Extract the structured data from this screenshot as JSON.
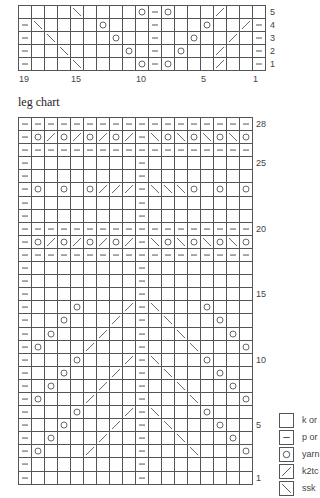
{
  "top_chart": {
    "columns": 19,
    "rows": [
      {
        "label": "5",
        "cells": [
          "",
          "",
          "",
          "",
          "ssk",
          "",
          "",
          "",
          "",
          "yo",
          "p",
          "yo",
          "",
          "",
          "",
          "k2tog",
          "",
          "",
          ""
        ]
      },
      {
        "label": "4",
        "cells": [
          "p",
          "ssk",
          "",
          "",
          "",
          "",
          "yo",
          "",
          "",
          "",
          "p",
          "",
          "",
          "",
          "yo",
          "",
          "",
          "k2tog",
          "p"
        ]
      },
      {
        "label": "3",
        "cells": [
          "p",
          "",
          "ssk",
          "",
          "",
          "",
          "",
          "yo",
          "",
          "",
          "p",
          "",
          "",
          "yo",
          "",
          "",
          "k2tog",
          "",
          "p"
        ]
      },
      {
        "label": "2",
        "cells": [
          "p",
          "",
          "",
          "ssk",
          "",
          "",
          "",
          "",
          "yo",
          "",
          "p",
          "",
          "yo",
          "",
          "",
          "k2tog",
          "",
          "",
          "p"
        ]
      },
      {
        "label": "1",
        "cells": [
          "p",
          "",
          "",
          "",
          "ssk",
          "",
          "",
          "",
          "",
          "yo",
          "p",
          "yo",
          "",
          "",
          "",
          "k2tog",
          "",
          "",
          "p"
        ]
      }
    ],
    "row_labels_shown": [
      "5",
      "4",
      "3",
      "2",
      "1"
    ],
    "col_labels": [
      {
        "text": "19",
        "col": 0
      },
      {
        "text": "15",
        "col": 4
      },
      {
        "text": "10",
        "col": 9
      },
      {
        "text": "5",
        "col": 14
      },
      {
        "text": "1",
        "col": 18
      }
    ]
  },
  "leg_chart": {
    "title": "leg chart",
    "columns": 18,
    "rows": [
      {
        "num": 28,
        "label": "28",
        "cells": [
          "p",
          "p",
          "p",
          "p",
          "p",
          "p",
          "p",
          "p",
          "p",
          "p",
          "p",
          "p",
          "p",
          "p",
          "p",
          "p",
          "p",
          "p"
        ]
      },
      {
        "num": 27,
        "label": "",
        "cells": [
          "p",
          "yo",
          "k2tog",
          "yo",
          "k2tog",
          "yo",
          "k2tog",
          "yo",
          "k2tog",
          "p",
          "ssk",
          "yo",
          "ssk",
          "yo",
          "ssk",
          "yo",
          "ssk",
          "yo"
        ]
      },
      {
        "num": 26,
        "label": "",
        "cells": [
          "p",
          "p",
          "p",
          "p",
          "p",
          "p",
          "p",
          "p",
          "p",
          "p",
          "p",
          "p",
          "p",
          "p",
          "p",
          "p",
          "p",
          "p"
        ]
      },
      {
        "num": 25,
        "label": "25",
        "cells": [
          "p",
          "",
          "",
          "",
          "",
          "",
          "",
          "",
          "",
          "p",
          "",
          "",
          "",
          "",
          "",
          "",
          "",
          ""
        ]
      },
      {
        "num": 24,
        "label": "",
        "cells": [
          "p",
          "",
          "",
          "",
          "",
          "",
          "",
          "",
          "",
          "p",
          "",
          "",
          "",
          "",
          "",
          "",
          "",
          ""
        ]
      },
      {
        "num": 23,
        "label": "",
        "cells": [
          "p",
          "yo",
          "",
          "yo",
          "",
          "yo",
          "k2tog",
          "k2tog",
          "k2tog",
          "p",
          "ssk",
          "ssk",
          "ssk",
          "yo",
          "",
          "yo",
          "",
          "yo"
        ]
      },
      {
        "num": 22,
        "label": "",
        "cells": [
          "p",
          "",
          "",
          "",
          "",
          "",
          "",
          "",
          "",
          "p",
          "",
          "",
          "",
          "",
          "",
          "",
          "",
          ""
        ]
      },
      {
        "num": 21,
        "label": "",
        "cells": [
          "p",
          "",
          "",
          "",
          "",
          "",
          "",
          "",
          "",
          "p",
          "",
          "",
          "",
          "",
          "",
          "",
          "",
          ""
        ]
      },
      {
        "num": 20,
        "label": "20",
        "cells": [
          "p",
          "p",
          "p",
          "p",
          "p",
          "p",
          "p",
          "p",
          "p",
          "p",
          "p",
          "p",
          "p",
          "p",
          "p",
          "p",
          "p",
          "p"
        ]
      },
      {
        "num": 19,
        "label": "",
        "cells": [
          "p",
          "yo",
          "k2tog",
          "yo",
          "k2tog",
          "yo",
          "k2tog",
          "yo",
          "k2tog",
          "p",
          "ssk",
          "yo",
          "ssk",
          "yo",
          "ssk",
          "yo",
          "ssk",
          "yo"
        ]
      },
      {
        "num": 18,
        "label": "",
        "cells": [
          "p",
          "p",
          "p",
          "p",
          "p",
          "p",
          "p",
          "p",
          "p",
          "p",
          "p",
          "p",
          "p",
          "p",
          "p",
          "p",
          "p",
          "p"
        ]
      },
      {
        "num": 17,
        "label": "",
        "cells": [
          "p",
          "",
          "",
          "",
          "",
          "",
          "",
          "",
          "",
          "p",
          "",
          "",
          "",
          "",
          "",
          "",
          "",
          ""
        ]
      },
      {
        "num": 16,
        "label": "",
        "cells": [
          "p",
          "",
          "",
          "",
          "",
          "",
          "",
          "",
          "",
          "p",
          "",
          "",
          "",
          "",
          "",
          "",
          "",
          ""
        ]
      },
      {
        "num": 15,
        "label": "15",
        "cells": [
          "p",
          "",
          "",
          "",
          "",
          "",
          "",
          "",
          "",
          "p",
          "",
          "",
          "",
          "",
          "",
          "",
          "",
          ""
        ]
      },
      {
        "num": 14,
        "label": "",
        "cells": [
          "p",
          "",
          "",
          "",
          "yo",
          "",
          "",
          "",
          "k2tog",
          "p",
          "ssk",
          "",
          "",
          "",
          "yo",
          "",
          "",
          ""
        ]
      },
      {
        "num": 13,
        "label": "",
        "cells": [
          "p",
          "",
          "",
          "yo",
          "",
          "",
          "",
          "k2tog",
          "",
          "p",
          "",
          "ssk",
          "",
          "",
          "",
          "yo",
          "",
          ""
        ]
      },
      {
        "num": 12,
        "label": "",
        "cells": [
          "p",
          "",
          "yo",
          "",
          "",
          "",
          "k2tog",
          "",
          "",
          "p",
          "",
          "",
          "ssk",
          "",
          "",
          "",
          "yo",
          ""
        ]
      },
      {
        "num": 11,
        "label": "",
        "cells": [
          "p",
          "yo",
          "",
          "",
          "",
          "k2tog",
          "",
          "",
          "",
          "p",
          "",
          "",
          "",
          "ssk",
          "",
          "",
          "",
          "yo"
        ]
      },
      {
        "num": 10,
        "label": "10",
        "cells": [
          "p",
          "",
          "",
          "",
          "yo",
          "",
          "",
          "",
          "k2tog",
          "p",
          "ssk",
          "",
          "",
          "",
          "yo",
          "",
          "",
          ""
        ]
      },
      {
        "num": 9,
        "label": "",
        "cells": [
          "p",
          "",
          "",
          "yo",
          "",
          "",
          "",
          "k2tog",
          "",
          "p",
          "",
          "ssk",
          "",
          "",
          "",
          "yo",
          "",
          ""
        ]
      },
      {
        "num": 8,
        "label": "",
        "cells": [
          "p",
          "",
          "yo",
          "",
          "",
          "",
          "k2tog",
          "",
          "",
          "p",
          "",
          "",
          "ssk",
          "",
          "",
          "",
          "yo",
          ""
        ]
      },
      {
        "num": 7,
        "label": "",
        "cells": [
          "p",
          "yo",
          "",
          "",
          "",
          "k2tog",
          "",
          "",
          "",
          "p",
          "",
          "",
          "",
          "ssk",
          "",
          "",
          "",
          "yo"
        ]
      },
      {
        "num": 6,
        "label": "",
        "cells": [
          "p",
          "",
          "",
          "",
          "yo",
          "",
          "",
          "",
          "k2tog",
          "p",
          "ssk",
          "",
          "",
          "",
          "yo",
          "",
          "",
          ""
        ]
      },
      {
        "num": 5,
        "label": "5",
        "cells": [
          "p",
          "",
          "",
          "yo",
          "",
          "",
          "",
          "k2tog",
          "",
          "p",
          "",
          "ssk",
          "",
          "",
          "",
          "yo",
          "",
          ""
        ]
      },
      {
        "num": 4,
        "label": "",
        "cells": [
          "p",
          "",
          "yo",
          "",
          "",
          "",
          "k2tog",
          "",
          "",
          "p",
          "",
          "",
          "ssk",
          "",
          "",
          "",
          "yo",
          ""
        ]
      },
      {
        "num": 3,
        "label": "",
        "cells": [
          "p",
          "yo",
          "",
          "",
          "",
          "k2tog",
          "",
          "",
          "",
          "p",
          "",
          "",
          "",
          "ssk",
          "",
          "",
          "",
          "yo"
        ]
      },
      {
        "num": 2,
        "label": "",
        "cells": [
          "p",
          "",
          "",
          "",
          "",
          "",
          "",
          "",
          "",
          "p",
          "",
          "",
          "",
          "",
          "",
          "",
          "",
          ""
        ]
      },
      {
        "num": 1,
        "label": "1",
        "cells": [
          "p",
          "",
          "",
          "",
          "",
          "",
          "",
          "",
          "",
          "p",
          "",
          "",
          "",
          "",
          "",
          "",
          "",
          ""
        ]
      }
    ]
  },
  "legend": {
    "items": [
      {
        "symbol": "knit",
        "icon": "empty-square-icon",
        "text": "k or"
      },
      {
        "symbol": "purl",
        "icon": "dash-icon",
        "text": "p or"
      },
      {
        "symbol": "yo",
        "icon": "circle-icon",
        "text": "yarn"
      },
      {
        "symbol": "k2tog",
        "icon": "right-slant-icon",
        "text": "k2tc"
      },
      {
        "symbol": "ssk",
        "icon": "left-slant-icon",
        "text": "ssk"
      }
    ]
  },
  "colors": {
    "grid": "#555555",
    "symbol": "#555555",
    "text": "#444444"
  }
}
